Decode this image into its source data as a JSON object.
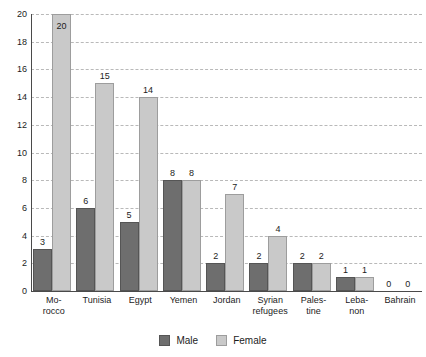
{
  "chart_data": {
    "type": "bar",
    "title": "",
    "subtitle": "",
    "xlabel": "",
    "ylabel": "",
    "ylim": [
      0,
      20
    ],
    "ytick_step": 2,
    "yticks": [
      "20",
      "18",
      "16",
      "14",
      "12",
      "10",
      "8",
      "6",
      "4",
      "2",
      "0"
    ],
    "grid": true,
    "legend_position": "bottom-center",
    "categories": [
      "Mo-rocco",
      "Tunisia",
      "Egypt",
      "Yemen",
      "Jordan",
      "Syrian refugees",
      "Pales-tine",
      "Leba-non",
      "Bahrain"
    ],
    "category_lines": [
      [
        "Mo-",
        "rocco"
      ],
      [
        "Tunisia"
      ],
      [
        "Egypt"
      ],
      [
        "Yemen"
      ],
      [
        "Jordan"
      ],
      [
        "Syrian",
        "refugees"
      ],
      [
        "Pales-",
        "tine"
      ],
      [
        "Leba-",
        "non"
      ],
      [
        "Bahrain"
      ]
    ],
    "series": [
      {
        "name": "Male",
        "color": "#6e6e6e",
        "values": [
          3,
          6,
          5,
          8,
          2,
          2,
          2,
          1,
          0
        ],
        "labels": [
          "3",
          "6",
          "5",
          "8",
          "2",
          "2",
          "2",
          "1",
          "0"
        ]
      },
      {
        "name": "Female",
        "color": "#c9c9c9",
        "values": [
          20,
          15,
          14,
          8,
          7,
          4,
          2,
          1,
          0
        ],
        "labels": [
          "20",
          "15",
          "14",
          "8",
          "7",
          "4",
          "2",
          "1",
          "0"
        ]
      }
    ]
  },
  "legend": {
    "items": [
      {
        "label": "Male",
        "color": "#6e6e6e"
      },
      {
        "label": "Female",
        "color": "#c9c9c9"
      }
    ]
  },
  "colors": {
    "male": "#6e6e6e",
    "female": "#c9c9c9",
    "axis": "#4a4a4a",
    "grid": "#b9b9b9",
    "text": "#1c1c1c",
    "background": "#ffffff"
  }
}
